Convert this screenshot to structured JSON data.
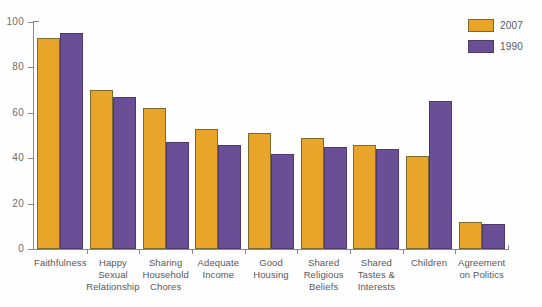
{
  "chart_data": {
    "type": "bar",
    "title": "",
    "subtitle": "",
    "xlabel": "",
    "ylabel": "",
    "ylim": [
      0,
      100
    ],
    "yticks": [
      0,
      20,
      40,
      60,
      80,
      100
    ],
    "grid": false,
    "legend_position": "top-right",
    "categories": [
      "Faithfulness",
      "Happy Sexual Relationship",
      "Sharing Household Chores",
      "Adequate Income",
      "Good Housing",
      "Shared Religious Beliefs",
      "Shared Tastes & Interests",
      "Children",
      "Agreement on Politics"
    ],
    "category_lines": [
      [
        "Faithfulness"
      ],
      [
        "Happy",
        "Sexual",
        "Relationship"
      ],
      [
        "Sharing",
        "Household",
        "Chores"
      ],
      [
        "Adequate",
        "Income"
      ],
      [
        "Good",
        "Housing"
      ],
      [
        "Shared",
        "Religious",
        "Beliefs"
      ],
      [
        "Shared",
        "Tastes &",
        "Interests"
      ],
      [
        "Children"
      ],
      [
        "Agreement",
        "on Politics"
      ]
    ],
    "series": [
      {
        "name": "2007",
        "color": "#e9a52a",
        "values": [
          93,
          70,
          62,
          53,
          51,
          49,
          46,
          41,
          12
        ]
      },
      {
        "name": "1990",
        "color": "#6a4f96",
        "values": [
          95,
          67,
          47,
          46,
          42,
          45,
          44,
          65,
          11
        ]
      }
    ]
  },
  "legend": {
    "items": [
      {
        "label": "2007",
        "color": "#e9a52a"
      },
      {
        "label": "1990",
        "color": "#6a4f96"
      }
    ]
  },
  "axis": {
    "y_tick_labels": [
      "100",
      "80",
      "60",
      "40",
      "20",
      "0"
    ]
  }
}
